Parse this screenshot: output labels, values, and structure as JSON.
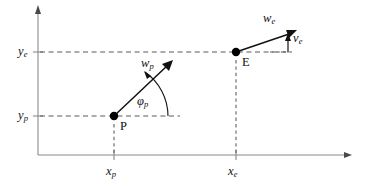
{
  "figure": {
    "type": "vector-kinematics-diagram",
    "background_color": "#ffffff",
    "axis_color": "#8a8a8a",
    "dashed_color": "#5a5a5a",
    "vector_color": "#111111"
  },
  "axes": {
    "x_axis_name": "x-axis",
    "y_axis_name": "y-axis",
    "origin_px": {
      "x": 38,
      "y": 155
    },
    "x_axis_end_px": {
      "x": 352,
      "y": 155
    },
    "y_axis_end_px": {
      "x": 38,
      "y": 6
    }
  },
  "tick_labels": {
    "x_p": {
      "base": "x",
      "sub": "p"
    },
    "x_e": {
      "base": "x",
      "sub": "e"
    },
    "y_p": {
      "base": "y",
      "sub": "p"
    },
    "y_e": {
      "base": "y",
      "sub": "e"
    }
  },
  "points": [
    {
      "id": "P",
      "label": "P",
      "px": {
        "x": 114,
        "y": 116
      },
      "x_tick_px": 114,
      "y_tick_px": 116
    },
    {
      "id": "E",
      "label": "E",
      "px": {
        "x": 236,
        "y": 52
      },
      "x_tick_px": 236,
      "y_tick_px": 52
    }
  ],
  "vectors": [
    {
      "id": "w_p",
      "base": "w",
      "sub": "p",
      "from_point": "P",
      "tip_px": {
        "x": 172,
        "y": 62
      },
      "label_px": {
        "x": 141,
        "y": 58
      }
    },
    {
      "id": "w_e",
      "base": "w",
      "sub": "e",
      "from_point": "E",
      "tip_px": {
        "x": 296,
        "y": 30
      },
      "label_px": {
        "x": 264,
        "y": 13
      }
    },
    {
      "id": "v_e",
      "base": "v",
      "sub": "e",
      "description": "vertical component of w_e",
      "from_px": {
        "x": 288,
        "y": 52
      },
      "tip_px": {
        "x": 288,
        "y": 35
      },
      "label_px": {
        "x": 292,
        "y": 33
      }
    }
  ],
  "angles": [
    {
      "id": "phi_p",
      "base": "φ",
      "sub": "p",
      "at_point": "P",
      "from": "positive-x-direction",
      "to": "w_p",
      "label_px": {
        "x": 139,
        "y": 96
      }
    }
  ],
  "guides": [
    {
      "name": "y_e-horizontal-dashed",
      "from_px": {
        "x": 38,
        "y": 52
      },
      "to_px": {
        "x": 289,
        "y": 52
      }
    },
    {
      "name": "y_p-horizontal-dashed",
      "from_px": {
        "x": 38,
        "y": 116
      },
      "to_px": {
        "x": 180,
        "y": 116
      }
    },
    {
      "name": "x_p-vertical-dashed",
      "from_px": {
        "x": 114,
        "y": 124
      },
      "to_px": {
        "x": 114,
        "y": 155
      }
    },
    {
      "name": "x_e-vertical-dashed",
      "from_px": {
        "x": 236,
        "y": 60
      },
      "to_px": {
        "x": 236,
        "y": 155
      }
    }
  ]
}
